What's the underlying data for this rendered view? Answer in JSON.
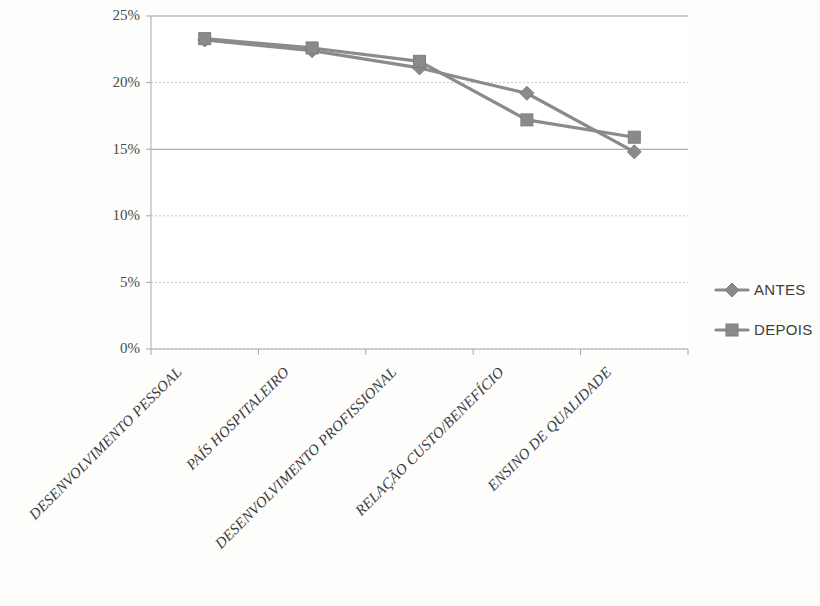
{
  "chart_data": {
    "type": "line",
    "title": "",
    "subtitle": "",
    "xlabel": "",
    "ylabel": "",
    "ylim": [
      0,
      25
    ],
    "ytick_labels": [
      "0%",
      "5%",
      "10%",
      "15%",
      "20%",
      "25%"
    ],
    "ytick_values": [
      0,
      5,
      10,
      15,
      20,
      25
    ],
    "grid": true,
    "legend_position": "right",
    "categories": [
      "DESENVOLVIMENTO PESSOAL",
      "PAÍS HOSPITALEIRO",
      "DESENVOLVIMENTO PROFISSIONAL",
      "RELAÇÃO CUSTO/BENEFÍCIO",
      "ENSINO DE QUALIDADE"
    ],
    "series": [
      {
        "name": "ANTES",
        "marker": "diamond",
        "color": "#8a8a8a",
        "values": [
          23.2,
          22.4,
          21.1,
          19.2,
          14.8
        ]
      },
      {
        "name": "DEPOIS",
        "marker": "square",
        "color": "#8a8a8a",
        "values": [
          23.3,
          22.6,
          21.6,
          17.2,
          15.9
        ]
      }
    ]
  },
  "legend": {
    "entries": [
      {
        "label": "ANTES",
        "marker": "diamond"
      },
      {
        "label": "DEPOIS",
        "marker": "square"
      }
    ]
  },
  "colors": {
    "series_line": "#8b8b8b",
    "marker_fill": "#8a8a8a",
    "gridline": "#c9c9c9",
    "gridline_major": "#9a9a9a",
    "axis": "#b0b0b0",
    "text": "#3c3c3c",
    "background": "#fdfdfc"
  }
}
